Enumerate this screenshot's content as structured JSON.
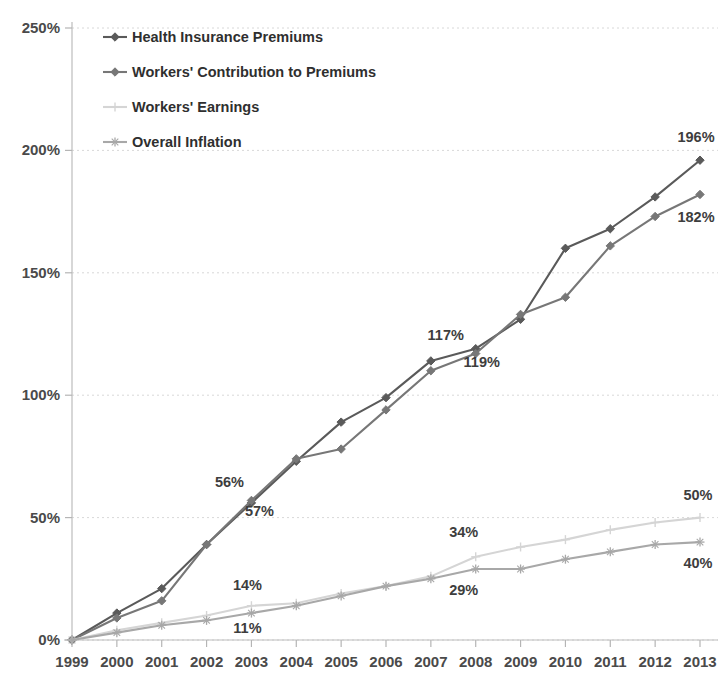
{
  "chart_data": {
    "type": "line",
    "title": "",
    "subtitle": "",
    "xlabel": "",
    "ylabel": "",
    "x": [
      "1999",
      "2000",
      "2001",
      "2002",
      "2003",
      "2004",
      "2005",
      "2006",
      "2007",
      "2008",
      "2009",
      "2010",
      "2011",
      "2012",
      "2013"
    ],
    "categories": [
      "1999",
      "2000",
      "2001",
      "2002",
      "2003",
      "2004",
      "2005",
      "2006",
      "2007",
      "2008",
      "2009",
      "2010",
      "2011",
      "2012",
      "2013"
    ],
    "ylim": [
      0,
      250
    ],
    "xlim_labels": [
      "1999",
      "2013"
    ],
    "ytick_labels": [
      "0%",
      "50%",
      "100%",
      "150%",
      "200%",
      "250%"
    ],
    "ytick_values": [
      0,
      50,
      100,
      150,
      200,
      250
    ],
    "grid": true,
    "legend_position": "top-left",
    "series": [
      {
        "name": "Health Insurance Premiums",
        "color": "#5a5a5a",
        "values": [
          0,
          11,
          21,
          39,
          56,
          73,
          89,
          99,
          114,
          119,
          131,
          160,
          168,
          181,
          196
        ],
        "marker": "diamond"
      },
      {
        "name": "Workers' Contribution to Premiums",
        "color": "#777777",
        "values": [
          0,
          9,
          16,
          39,
          57,
          74,
          78,
          94,
          110,
          117,
          133,
          140,
          161,
          173,
          182
        ],
        "marker": "diamond"
      },
      {
        "name": "Workers' Earnings",
        "color": "#d5d5d5",
        "values": [
          0,
          4,
          7,
          10,
          14,
          15,
          19,
          22,
          26,
          34,
          38,
          41,
          45,
          48,
          50
        ],
        "marker": "plus"
      },
      {
        "name": "Overall Inflation",
        "color": "#a8a8a8",
        "values": [
          0,
          3,
          6,
          8,
          11,
          14,
          18,
          22,
          25,
          29,
          29,
          33,
          36,
          39,
          40
        ],
        "marker": "star"
      }
    ],
    "annotations": [
      {
        "text": "56%",
        "series": "Health Insurance Premiums",
        "x": "2003",
        "value": 56,
        "dx": -22,
        "dy": -16
      },
      {
        "text": "57%",
        "series": "Workers' Contribution to Premiums",
        "x": "2003",
        "value": 57,
        "dx": 8,
        "dy": 16
      },
      {
        "text": "117%",
        "series": "Health Insurance Premiums",
        "x": "2008",
        "value": 117,
        "dx": -30,
        "dy": -14
      },
      {
        "text": "119%",
        "series": "Workers' Contribution to Premiums",
        "x": "2008",
        "value": 119,
        "dx": 6,
        "dy": 18
      },
      {
        "text": "196%",
        "series": "Health Insurance Premiums",
        "x": "2013",
        "value": 196,
        "dx": -4,
        "dy": -18
      },
      {
        "text": "182%",
        "series": "Workers' Contribution to Premiums",
        "x": "2013",
        "value": 182,
        "dx": -4,
        "dy": 28
      },
      {
        "text": "14%",
        "series": "Workers' Earnings",
        "x": "2003",
        "value": 14,
        "dx": -4,
        "dy": -16
      },
      {
        "text": "11%",
        "series": "Overall Inflation",
        "x": "2003",
        "value": 11,
        "dx": -4,
        "dy": 20
      },
      {
        "text": "34%",
        "series": "Workers' Earnings",
        "x": "2008",
        "value": 34,
        "dx": -12,
        "dy": -20
      },
      {
        "text": "29%",
        "series": "Overall Inflation",
        "x": "2008",
        "value": 29,
        "dx": -12,
        "dy": 26
      },
      {
        "text": "50%",
        "series": "Workers' Earnings",
        "x": "2013",
        "value": 50,
        "dx": -2,
        "dy": -18
      },
      {
        "text": "40%",
        "series": "Overall Inflation",
        "x": "2013",
        "value": 40,
        "dx": -2,
        "dy": 26
      }
    ]
  },
  "legend": {
    "items": [
      {
        "label": "Health Insurance Premiums",
        "color": "#5a5a5a"
      },
      {
        "label": "Workers' Contribution to Premiums",
        "color": "#777777"
      },
      {
        "label": "Workers' Earnings",
        "color": "#d5d5d5"
      },
      {
        "label": "Overall Inflation",
        "color": "#a8a8a8"
      }
    ]
  },
  "axes": {
    "y_ticks": [
      "250%",
      "200%",
      "150%",
      "100%",
      "50%",
      "0%"
    ],
    "x_ticks": [
      "1999",
      "2000",
      "2001",
      "2002",
      "2003",
      "2004",
      "2005",
      "2006",
      "2007",
      "2008",
      "2009",
      "2010",
      "2011",
      "2012",
      "2013"
    ]
  }
}
